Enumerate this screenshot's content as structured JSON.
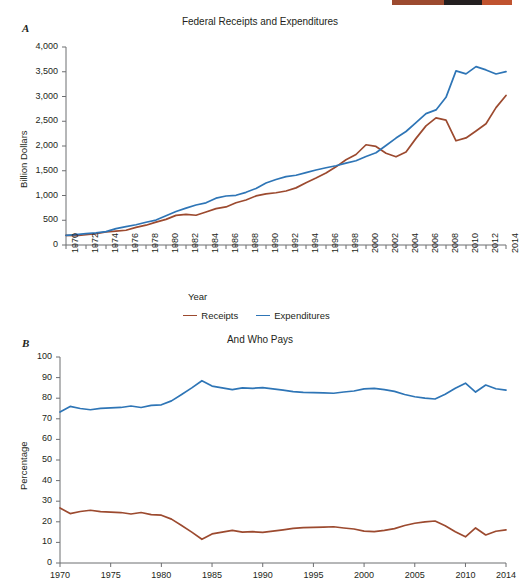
{
  "figure": {
    "panels": [
      {
        "letter": "A",
        "title": "Federal Receipts and Expenditures",
        "xlabel": "Year",
        "ylabel": "Billion Dollars"
      },
      {
        "letter": "B",
        "title": "And Who Pays",
        "xlabel": "",
        "ylabel": "Percentage"
      }
    ]
  },
  "colors": {
    "receipts": "#9c4a2f",
    "expenditures": "#2e75b6",
    "axis": "#6d6e71",
    "text": "#231f20"
  },
  "legend": {
    "position": "bottom-center",
    "items": [
      {
        "label": "Receipts",
        "color": "#9c4a2f"
      },
      {
        "label": "Expenditures",
        "color": "#2e75b6"
      }
    ]
  },
  "chart_data": [
    {
      "type": "line",
      "panel": "A",
      "title": "Federal Receipts and Expenditures",
      "xlabel": "Year",
      "ylabel": "Billion Dollars",
      "xlim": [
        1970,
        2014
      ],
      "ylim": [
        0,
        4000
      ],
      "ytick_labels": [
        "0",
        "500",
        "1,000",
        "1,500",
        "2,000",
        "2,500",
        "3,000",
        "3,500",
        "4,000"
      ],
      "yticks": [
        0,
        500,
        1000,
        1500,
        2000,
        2500,
        3000,
        3500,
        4000
      ],
      "xticks": [
        1970,
        1972,
        1974,
        1976,
        1978,
        1980,
        1982,
        1984,
        1986,
        1988,
        1990,
        1992,
        1994,
        1996,
        1998,
        2000,
        2002,
        2004,
        2006,
        2008,
        2010,
        2012,
        2014
      ],
      "xtick_labels": [
        "1970",
        "1972",
        "1974",
        "1976",
        "1978",
        "1980",
        "1982",
        "1984",
        "1986",
        "1988",
        "1990",
        "1992",
        "1994",
        "1996",
        "1998",
        "2000",
        "2002",
        "2004",
        "2006",
        "2008",
        "2010",
        "2012",
        "2014"
      ],
      "minor_xticks_every": 1,
      "grid": false,
      "x": [
        1970,
        1971,
        1972,
        1973,
        1974,
        1975,
        1976,
        1977,
        1978,
        1979,
        1980,
        1981,
        1982,
        1983,
        1984,
        1985,
        1986,
        1987,
        1988,
        1989,
        1990,
        1991,
        1992,
        1993,
        1994,
        1995,
        1996,
        1997,
        1998,
        1999,
        2000,
        2001,
        2002,
        2003,
        2004,
        2005,
        2006,
        2007,
        2008,
        2009,
        2010,
        2011,
        2012,
        2013,
        2014
      ],
      "series": [
        {
          "name": "Receipts",
          "color": "#9c4a2f",
          "values": [
            193,
            187,
            207,
            231,
            263,
            279,
            298,
            356,
            400,
            463,
            517,
            599,
            618,
            601,
            666,
            734,
            769,
            854,
            909,
            991,
            1032,
            1055,
            1091,
            1154,
            1259,
            1352,
            1453,
            1579,
            1722,
            1828,
            2025,
            1991,
            1853,
            1782,
            1880,
            2154,
            2407,
            2568,
            2524,
            2105,
            2163,
            2304,
            2450,
            2775,
            3021
          ]
        },
        {
          "name": "Expenditures",
          "color": "#2e75b6",
          "values": [
            196,
            210,
            231,
            246,
            269,
            332,
            372,
            409,
            459,
            504,
            591,
            678,
            746,
            808,
            852,
            946,
            990,
            1004,
            1064,
            1143,
            1253,
            1324,
            1382,
            1409,
            1462,
            1516,
            1561,
            1601,
            1653,
            1702,
            1789,
            1863,
            2011,
            2160,
            2293,
            2472,
            2655,
            2729,
            2983,
            3518,
            3457,
            3603,
            3537,
            3455,
            3504
          ]
        }
      ]
    },
    {
      "type": "line",
      "panel": "B",
      "title": "And Who Pays",
      "xlabel": "",
      "ylabel": "Percentage",
      "xlim": [
        1970,
        2014
      ],
      "ylim": [
        0,
        100
      ],
      "yticks": [
        0,
        10,
        20,
        30,
        40,
        50,
        60,
        70,
        80,
        90,
        100
      ],
      "ytick_labels": [
        "0",
        "10",
        "20",
        "30",
        "40",
        "50",
        "60",
        "70",
        "80",
        "90",
        "100"
      ],
      "xticks": [
        1970,
        1975,
        1980,
        1985,
        1990,
        1995,
        2000,
        2005,
        2010,
        2014
      ],
      "xtick_labels": [
        "1970",
        "1975",
        "1980",
        "1985",
        "1990",
        "1995",
        "2000",
        "2005",
        "2010",
        "2014"
      ],
      "grid": false,
      "x": [
        1970,
        1971,
        1972,
        1973,
        1974,
        1975,
        1976,
        1977,
        1978,
        1979,
        1980,
        1981,
        1982,
        1983,
        1984,
        1985,
        1986,
        1987,
        1988,
        1989,
        1990,
        1991,
        1992,
        1993,
        1994,
        1995,
        1996,
        1997,
        1998,
        1999,
        2000,
        2001,
        2002,
        2003,
        2004,
        2005,
        2006,
        2007,
        2008,
        2009,
        2010,
        2011,
        2012,
        2013,
        2014
      ],
      "series": [
        {
          "name": "Individuals",
          "color": "#2e75b6",
          "values": [
            73.3,
            76.0,
            75.0,
            74.4,
            75.1,
            75.3,
            75.5,
            76.2,
            75.5,
            76.5,
            76.8,
            78.7,
            81.8,
            85.0,
            88.5,
            85.9,
            85.0,
            84.2,
            85.0,
            84.8,
            85.1,
            84.5,
            83.9,
            83.2,
            82.8,
            82.7,
            82.6,
            82.4,
            83.0,
            83.5,
            84.5,
            84.8,
            84.2,
            83.3,
            81.8,
            80.7,
            80.0,
            79.6,
            81.9,
            84.8,
            87.3,
            83.0,
            86.4,
            84.6,
            83.9,
            82.5
          ]
        },
        {
          "name": "Corporations",
          "color": "#9c4a2f",
          "values": [
            26.7,
            24.0,
            25.0,
            25.6,
            24.9,
            24.7,
            24.5,
            23.8,
            24.5,
            23.5,
            23.2,
            21.3,
            18.2,
            15.0,
            11.5,
            14.1,
            15.0,
            15.8,
            15.0,
            15.2,
            14.9,
            15.5,
            16.1,
            16.8,
            17.2,
            17.3,
            17.4,
            17.6,
            17.0,
            16.5,
            15.5,
            15.2,
            15.8,
            16.7,
            18.2,
            19.3,
            20.0,
            20.4,
            18.1,
            15.2,
            12.7,
            17.0,
            13.6,
            15.4,
            16.1,
            17.5
          ]
        }
      ]
    }
  ]
}
